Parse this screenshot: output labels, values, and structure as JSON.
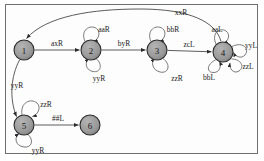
{
  "diagram": {
    "kind": "turing-machine-state-diagram",
    "background_color": "#ffffff",
    "frame_color": "#6f6f6f",
    "node_fill": "#9a9a9a",
    "node_stroke": "#2b2b2b",
    "edge_color": "#4a4a4a",
    "states": [
      {
        "id": "1",
        "label": "1",
        "cx": 24,
        "cy": 50,
        "r": 10
      },
      {
        "id": "2",
        "label": "2",
        "cx": 91,
        "cy": 50,
        "r": 10
      },
      {
        "id": "3",
        "label": "3",
        "cx": 157,
        "cy": 50,
        "r": 10
      },
      {
        "id": "4",
        "label": "4",
        "cx": 223,
        "cy": 52,
        "r": 10
      },
      {
        "id": "5",
        "label": "5",
        "cx": 24,
        "cy": 125,
        "r": 10
      },
      {
        "id": "6",
        "label": "6",
        "cx": 90,
        "cy": 125,
        "r": 10
      }
    ],
    "transitions": [
      {
        "from": "1",
        "to": "2",
        "label": "axR",
        "label_x": 57,
        "label_y": 43
      },
      {
        "from": "2",
        "to": "3",
        "label": "byR",
        "label_x": 124,
        "label_y": 43
      },
      {
        "from": "3",
        "to": "4",
        "label": "zcL",
        "label_x": 189,
        "label_y": 44
      },
      {
        "from": "4",
        "to": "1",
        "label": "xxR",
        "label_x": 181,
        "label_y": 12
      },
      {
        "from": "1",
        "to": "5",
        "label": "yyR",
        "label_x": 17,
        "label_y": 85
      },
      {
        "from": "5",
        "to": "6",
        "label": "##L",
        "label_x": 58,
        "label_y": 118
      }
    ],
    "self_loops": [
      {
        "state": "2",
        "label": "aaR",
        "label_x": 104,
        "label_y": 29
      },
      {
        "state": "2",
        "label": "yyR",
        "label_x": 99,
        "label_y": 78
      },
      {
        "state": "3",
        "label": "bbR",
        "label_x": 173,
        "label_y": 29
      },
      {
        "state": "3",
        "label": "zzR",
        "label_x": 177,
        "label_y": 78
      },
      {
        "state": "4",
        "label": "aaL",
        "label_x": 217,
        "label_y": 29
      },
      {
        "state": "4",
        "label": "yyL",
        "label_x": 250,
        "label_y": 46
      },
      {
        "state": "4",
        "label": "zzL",
        "label_x": 247,
        "label_y": 66
      },
      {
        "state": "4",
        "label": "bbL",
        "label_x": 210,
        "label_y": 76
      },
      {
        "state": "5",
        "label": "zzR",
        "label_x": 46,
        "label_y": 104
      },
      {
        "state": "5",
        "label": "yyR",
        "label_x": 37,
        "label_y": 150
      }
    ]
  }
}
